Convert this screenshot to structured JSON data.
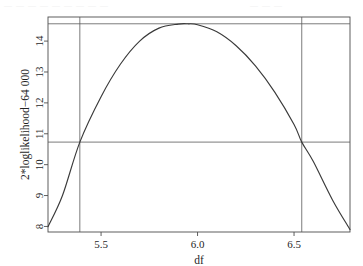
{
  "figure": {
    "background_color": "#ffffff",
    "ink_color": "#3a3a3a",
    "frame_color": "#4d4d4d",
    "artifact_top_left": "—  — —    — —  —      — — —",
    "artifact_top_right": "—  —  —"
  },
  "chart_data": {
    "type": "line",
    "title": "",
    "subtitle": "",
    "xlabel": "df",
    "ylabel": "2*loglikelihood−64 000",
    "xlim": [
      5.225,
      6.79
    ],
    "ylim": [
      7.82,
      14.78
    ],
    "xticks": [
      5.5,
      6.0,
      6.5
    ],
    "xtick_labels": [
      "5.5",
      "6.0",
      "6.5"
    ],
    "yticks": [
      8,
      9,
      10,
      11,
      12,
      13,
      14
    ],
    "ytick_labels": [
      "8",
      "9",
      "10",
      "11",
      "12",
      "13",
      "14"
    ],
    "grid": false,
    "legend": null,
    "legend_position": "none",
    "series": [
      {
        "name": "profile 2*loglikelihood",
        "type": "line",
        "color": "#3a3a3a",
        "x": [
          5.225,
          5.3,
          5.39,
          5.5,
          5.6,
          5.7,
          5.8,
          5.9,
          5.95,
          6.0,
          6.1,
          6.2,
          6.3,
          6.4,
          6.5,
          6.54,
          6.6,
          6.7,
          6.79
        ],
        "y": [
          7.99,
          9.0,
          10.73,
          12.2,
          13.25,
          14.0,
          14.42,
          14.55,
          14.56,
          14.53,
          14.3,
          13.85,
          13.2,
          12.35,
          11.3,
          10.73,
          10.1,
          8.85,
          7.9
        ]
      }
    ],
    "annotations": [
      {
        "name": "max-loglikelihood-line",
        "type": "hline",
        "y": 14.56,
        "label": "maximum 2*loglikelihood"
      },
      {
        "name": "confidence-cutoff-line",
        "type": "hline",
        "y": 10.73,
        "label": "95% cutoff (max − 3.84)"
      },
      {
        "name": "ci-lower-line",
        "type": "vline",
        "x": 5.39,
        "label": "lower confidence limit"
      },
      {
        "name": "ci-upper-line",
        "type": "vline",
        "x": 6.54,
        "label": "upper confidence limit"
      }
    ]
  }
}
